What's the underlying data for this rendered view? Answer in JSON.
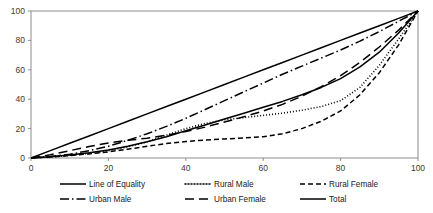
{
  "chart_data": {
    "type": "line",
    "title": "",
    "subtitle": "",
    "xlabel": "",
    "ylabel": "",
    "xlim": [
      0,
      100
    ],
    "ylim": [
      0,
      100
    ],
    "grid": false,
    "legend_position": "bottom",
    "x_ticks": [
      "0",
      "20",
      "40",
      "60",
      "80",
      "100"
    ],
    "y_ticks": [
      "0",
      "20",
      "40",
      "60",
      "80",
      "100"
    ],
    "x_tick_values": [
      0,
      20,
      40,
      60,
      80,
      100
    ],
    "y_tick_values": [
      0,
      20,
      40,
      60,
      80,
      100
    ],
    "x": [
      0,
      5,
      10,
      15,
      20,
      25,
      30,
      35,
      40,
      45,
      50,
      55,
      60,
      65,
      70,
      75,
      80,
      85,
      90,
      95,
      100
    ],
    "series": [
      {
        "name": "Line of Equality",
        "style": "solid",
        "values": [
          0,
          5,
          10,
          15,
          20,
          25,
          30,
          35,
          40,
          45,
          50,
          55,
          60,
          65,
          70,
          75,
          80,
          85,
          90,
          95,
          100
        ]
      },
      {
        "name": "Rural Male",
        "style": "dotted",
        "values": [
          0,
          0.8,
          1.8,
          3.2,
          5.0,
          7.5,
          11.0,
          15.5,
          20.0,
          23.5,
          26.0,
          27.5,
          29.0,
          30.5,
          32.5,
          35.0,
          39.0,
          48.0,
          63.0,
          81.0,
          100
        ]
      },
      {
        "name": "Rural Female",
        "style": "dashed",
        "values": [
          0,
          0.7,
          1.6,
          2.8,
          4.2,
          6.0,
          8.0,
          9.8,
          11.2,
          12.2,
          13.0,
          13.6,
          14.5,
          16.5,
          20.0,
          25.0,
          32.0,
          43.0,
          58.0,
          77.0,
          100
        ]
      },
      {
        "name": "Urban Male",
        "style": "dashdot",
        "values": [
          0,
          1.0,
          2.5,
          5.0,
          8.0,
          12.0,
          16.5,
          21.5,
          27.0,
          33.0,
          39.0,
          45.0,
          51.0,
          57.0,
          62.5,
          68.0,
          73.5,
          79.5,
          86.0,
          93.0,
          100
        ]
      },
      {
        "name": "Urban Female",
        "style": "longdash",
        "values": [
          0,
          2.2,
          5.0,
          7.8,
          10.2,
          12.0,
          13.5,
          15.5,
          18.0,
          21.0,
          24.5,
          28.0,
          32.0,
          36.5,
          42.0,
          48.5,
          56.0,
          65.0,
          75.5,
          87.0,
          100
        ]
      },
      {
        "name": "Total",
        "style": "solid",
        "values": [
          0,
          0.9,
          2.0,
          3.5,
          5.5,
          8.0,
          11.0,
          14.5,
          18.5,
          22.5,
          26.5,
          30.5,
          34.5,
          38.5,
          43.0,
          48.0,
          54.0,
          62.0,
          72.0,
          85.0,
          100
        ]
      }
    ]
  },
  "legend": {
    "items": [
      {
        "label": "Line of Equality",
        "style": "solid"
      },
      {
        "label": "Rural Male",
        "style": "dotted"
      },
      {
        "label": "Rural Female",
        "style": "dashed"
      },
      {
        "label": "Urban Male",
        "style": "dashdot"
      },
      {
        "label": "Urban Female",
        "style": "longdash"
      },
      {
        "label": "Total",
        "style": "solid"
      }
    ]
  },
  "colors": {
    "series": "#000000",
    "axis": "#8c8c8c",
    "tick_text": "#3a3a3a",
    "legend_text": "#1a1a1a",
    "background": "#ffffff"
  }
}
